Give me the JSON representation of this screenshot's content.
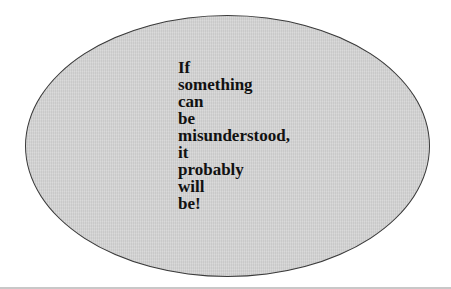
{
  "figure": {
    "shape": "ellipse",
    "fill_color": "#d3d3d3",
    "border_color": "#3a3a3a",
    "quote_lines": [
      "If",
      "something",
      "can",
      "be",
      "misunderstood,",
      "it",
      "probably",
      "will",
      "be!"
    ]
  }
}
